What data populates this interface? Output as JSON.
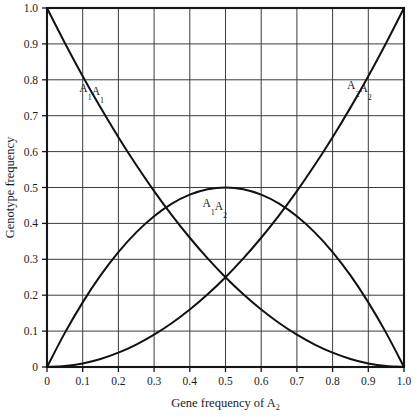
{
  "chart_data": {
    "type": "line",
    "title": "",
    "xlabel": "Gene frequency of A₂",
    "ylabel": "Genotype frequency",
    "xlabel_parts": {
      "text": "Gene frequency of A",
      "sub": "2"
    },
    "xlim": [
      0,
      1
    ],
    "ylim": [
      0,
      1
    ],
    "grid": true,
    "grid_x_step": 0.1,
    "grid_y_step": 0.1,
    "legend": "inline-labels",
    "xticks": [
      0,
      0.1,
      0.2,
      0.3,
      0.4,
      0.5,
      0.6,
      0.7,
      0.8,
      0.9,
      1.0
    ],
    "xtick_labels": [
      "0",
      "0.1",
      "0.2",
      "0.3",
      "0.4",
      "0.5",
      "0.6",
      "0.7",
      "0.8",
      "0.9",
      "1.0"
    ],
    "yticks": [
      0,
      0.1,
      0.2,
      0.3,
      0.4,
      0.5,
      0.6,
      0.7,
      0.8,
      0.9,
      1.0
    ],
    "ytick_labels": [
      "0",
      "0.1",
      "0.2",
      "0.3",
      "0.4",
      "0.5",
      "0.6",
      "0.7",
      "0.8",
      "0.9",
      "1.0"
    ],
    "x": [
      0,
      0.05,
      0.1,
      0.15,
      0.2,
      0.25,
      0.3,
      0.35,
      0.4,
      0.45,
      0.5,
      0.55,
      0.6,
      0.65,
      0.7,
      0.75,
      0.8,
      0.85,
      0.9,
      0.95,
      1.0
    ],
    "series": [
      {
        "name": "A₁A₁",
        "formula": "p^2 = (1-q)^2",
        "label_parts": [
          {
            "base": "A",
            "sub": "1"
          },
          {
            "base": "A",
            "sub": "1"
          }
        ],
        "label_x": 0.125,
        "label_y": 0.765,
        "values": [
          1.0,
          0.9025,
          0.81,
          0.7225,
          0.64,
          0.5625,
          0.49,
          0.4225,
          0.36,
          0.3025,
          0.25,
          0.2025,
          0.16,
          0.1225,
          0.09,
          0.0625,
          0.04,
          0.0225,
          0.01,
          0.0025,
          0.0
        ]
      },
      {
        "name": "A₁A₂",
        "formula": "2pq = 2q(1-q)",
        "label_parts": [
          {
            "base": "A",
            "sub": "1"
          },
          {
            "base": "A",
            "sub": "2"
          }
        ],
        "label_x": 0.47,
        "label_y": 0.445,
        "values": [
          0.0,
          0.095,
          0.18,
          0.255,
          0.32,
          0.375,
          0.42,
          0.455,
          0.48,
          0.495,
          0.5,
          0.495,
          0.48,
          0.455,
          0.42,
          0.375,
          0.32,
          0.255,
          0.18,
          0.095,
          0.0
        ]
      },
      {
        "name": "A₂A₂",
        "formula": "q^2",
        "label_parts": [
          {
            "base": "A",
            "sub": "2"
          },
          {
            "base": "A",
            "sub": "2"
          }
        ],
        "label_x": 0.875,
        "label_y": 0.775,
        "values": [
          0.0,
          0.0025,
          0.01,
          0.0225,
          0.04,
          0.0625,
          0.09,
          0.1225,
          0.16,
          0.2025,
          0.25,
          0.3025,
          0.36,
          0.4225,
          0.49,
          0.5625,
          0.64,
          0.7225,
          0.81,
          0.9025,
          1.0
        ]
      }
    ],
    "annotations": [
      {
        "text": "p² and q² intersect at q = 0.5, frequency = 0.25"
      }
    ]
  },
  "style": {
    "background": "#ffffff",
    "axis_color": "#15161a",
    "grid_color": "#3a3c42",
    "curve_color": "#101114"
  },
  "geometry": {
    "plot_left": 47,
    "plot_right": 404,
    "plot_top": 8,
    "plot_bottom": 367
  }
}
